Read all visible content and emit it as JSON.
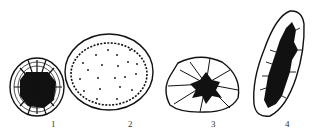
{
  "figure": {
    "items": [
      {
        "id": 1,
        "label": "1",
        "shape": "small round body with dark concentric-lined core"
      },
      {
        "id": 2,
        "label": "2",
        "shape": "large oval with serrated rim and scattered dots"
      },
      {
        "id": 3,
        "label": "3",
        "shape": "rounded triangle with dark branching star-shaped core"
      },
      {
        "id": 4,
        "label": "4",
        "shape": "elongated tilted oval with dark spiky elongated core"
      }
    ],
    "colors": {
      "ink": "#111111",
      "background": "#ffffff"
    }
  }
}
